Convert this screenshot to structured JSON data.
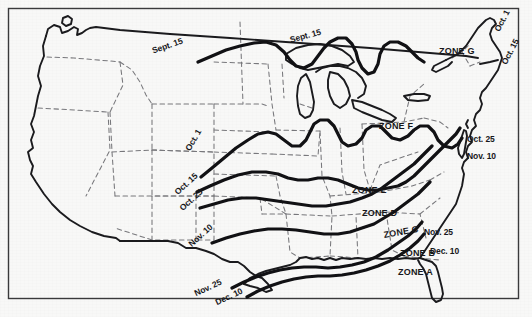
{
  "figure": {
    "region": "Contiguous United States",
    "background_color": "#f8f8f7",
    "ink_color": "#17171a",
    "border_color": "#3a3a3c",
    "coastline_color": "#1b1b1e",
    "state_border_color": "#6e6e72",
    "contour_color": "#111114"
  },
  "chart_data": {
    "type": "map",
    "contour_lines": [
      {
        "label": "Sept. 15",
        "order": 1
      },
      {
        "label": "Oct. 1",
        "order": 2
      },
      {
        "label": "Oct. 15",
        "order": 3
      },
      {
        "label": "Oct. 25",
        "order": 4
      },
      {
        "label": "Nov. 10",
        "order": 5
      },
      {
        "label": "Nov. 25",
        "order": 6
      },
      {
        "label": "Dec. 10",
        "order": 7
      }
    ],
    "zones": [
      "ZONE A",
      "ZONE B",
      "ZONE C",
      "ZONE D",
      "ZONE E",
      "ZONE F",
      "ZONE G"
    ]
  },
  "date_labels": [
    {
      "id": "sept15-west",
      "text": "Sept. 15",
      "x": 151,
      "y": 47,
      "rotate": -19
    },
    {
      "id": "sept15-east",
      "text": "Sept. 15",
      "x": 289,
      "y": 36,
      "rotate": -15
    },
    {
      "id": "oct1-west",
      "text": "Oct. 1",
      "x": 184,
      "y": 148,
      "rotate": -60
    },
    {
      "id": "oct15-west",
      "text": "Oct. 15",
      "x": 173,
      "y": 190,
      "rotate": -42
    },
    {
      "id": "oct25-west",
      "text": "Oct. 25",
      "x": 178,
      "y": 206,
      "rotate": -42
    },
    {
      "id": "nov10-west",
      "text": "Nov. 10",
      "x": 187,
      "y": 242,
      "rotate": -42
    },
    {
      "id": "nov25-west",
      "text": "Nov. 25",
      "x": 193,
      "y": 290,
      "rotate": -25
    },
    {
      "id": "dec10-west",
      "text": "Dec. 10",
      "x": 214,
      "y": 299,
      "rotate": -25
    },
    {
      "id": "oct1-east",
      "text": "Oct. 1",
      "x": 493,
      "y": 29,
      "rotate": -62
    },
    {
      "id": "oct15-east",
      "text": "Oct. 15",
      "x": 500,
      "y": 62,
      "rotate": -62
    },
    {
      "id": "oct25-east",
      "text": "Oct. 25",
      "x": 467,
      "y": 135,
      "rotate": 0
    },
    {
      "id": "nov10-east",
      "text": "Nov. 10",
      "x": 467,
      "y": 152,
      "rotate": 0
    },
    {
      "id": "nov25-east",
      "text": "Nov. 25",
      "x": 424,
      "y": 228,
      "rotate": 0
    },
    {
      "id": "dec10-east",
      "text": "Dec. 10",
      "x": 430,
      "y": 247,
      "rotate": 0
    }
  ],
  "zone_labels": [
    {
      "id": "zone-a",
      "text": "ZONE A",
      "x": 398,
      "y": 268
    },
    {
      "id": "zone-b",
      "text": "ZONE B",
      "x": 400,
      "y": 249
    },
    {
      "id": "zone-c",
      "text": "ZONE C",
      "x": 383,
      "y": 231,
      "rotate": -10
    },
    {
      "id": "zone-d",
      "text": "ZONE D",
      "x": 362,
      "y": 209
    },
    {
      "id": "zone-e",
      "text": "ZONE E",
      "x": 352,
      "y": 186
    },
    {
      "id": "zone-f",
      "text": "ZONE F",
      "x": 379,
      "y": 122
    },
    {
      "id": "zone-g",
      "text": "ZONE G",
      "x": 439,
      "y": 47
    }
  ]
}
